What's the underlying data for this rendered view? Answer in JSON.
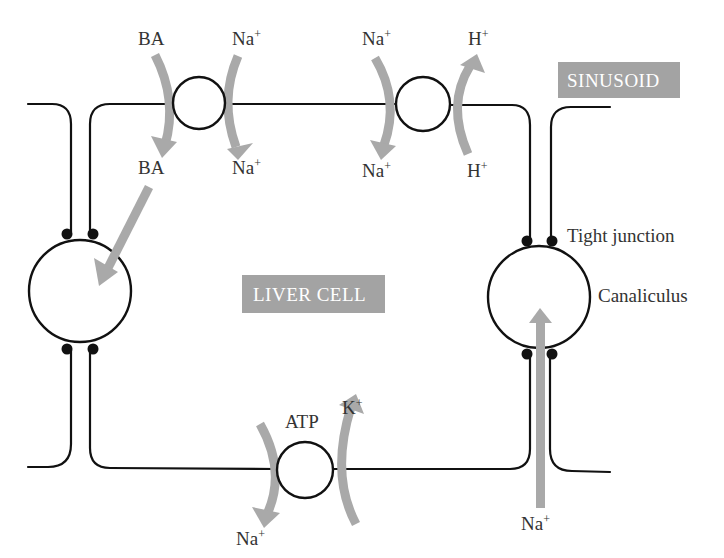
{
  "diagram": {
    "regions": {
      "sinusoid": "SINUSOID",
      "liver_cell": "LIVER CELL"
    },
    "structure_labels": {
      "tight_junction": "Tight junction",
      "canaliculus": "Canaliculus"
    },
    "transporters": [
      {
        "id": "ba-na-symporter",
        "location": "sinusoidal membrane, left",
        "flows": [
          {
            "substance": "BA",
            "from": "sinusoid",
            "to": "cell",
            "label_top": "BA",
            "label_bottom": "BA"
          },
          {
            "substance": "Na+",
            "from": "sinusoid",
            "to": "cell",
            "label_top": "Na",
            "label_top_sup": "+",
            "label_bottom": "Na",
            "label_bottom_sup": "+"
          }
        ]
      },
      {
        "id": "na-h-exchanger",
        "location": "sinusoidal membrane, right",
        "flows": [
          {
            "substance": "Na+",
            "from": "sinusoid",
            "to": "cell",
            "label_top": "Na",
            "label_top_sup": "+",
            "label_bottom": "Na",
            "label_bottom_sup": "+"
          },
          {
            "substance": "H+",
            "from": "cell",
            "to": "sinusoid",
            "label_top": "H",
            "label_top_sup": "+",
            "label_bottom": "H",
            "label_bottom_sup": "+"
          }
        ]
      },
      {
        "id": "na-k-atpase",
        "location": "basolateral membrane, bottom",
        "label": "ATP",
        "flows": [
          {
            "substance": "Na+",
            "from": "cell",
            "to": "outside",
            "label": "Na",
            "label_sup": "+"
          },
          {
            "substance": "K+",
            "from": "outside",
            "to": "cell",
            "label": "K",
            "label_sup": "+"
          }
        ]
      }
    ],
    "other_flows": [
      {
        "substance": "BA",
        "from": "cell",
        "to": "left canaliculus"
      },
      {
        "substance": "Na+",
        "from": "paracellular",
        "to": "right canaliculus",
        "label": "Na",
        "label_sup": "+"
      }
    ],
    "colors": {
      "membrane": "#111111",
      "flow_arrow": "#a9a9a9",
      "label_box": "#a3a3a3",
      "label_text": "#333333"
    }
  }
}
